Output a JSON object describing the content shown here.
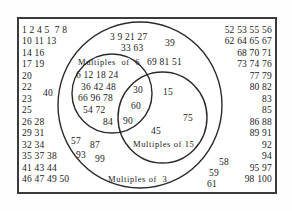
{
  "diagram": {
    "type": "venn-diagram",
    "universe_label": "",
    "border_color": "#3b3b3b",
    "circle_color": "#2b2b2b",
    "sets": [
      {
        "id": "multiples-of-3",
        "label": "Multiples of  3"
      },
      {
        "id": "multiples-of-6",
        "label": "Multiples  of  6"
      },
      {
        "id": "multiples-of-15",
        "label": "Multiples of 15"
      }
    ],
    "regions": {
      "outside_left": {
        "name": "outside-sets-left",
        "lines": [
          "1 2 4 5  7 8",
          "10 11 13",
          "14 16",
          "17 19",
          "20",
          "22",
          "23",
          "25",
          "26 28",
          "29 31",
          "32 34",
          "35 37 38",
          "41 43 44",
          "46 47 49 50"
        ],
        "floating": [
          {
            "value": "40"
          }
        ]
      },
      "outside_right": {
        "name": "outside-sets-right",
        "lines": [
          "52 53 55 56",
          "62 64 65 67",
          "68 70 71",
          "73 74 76",
          "77 79",
          "80 82",
          "83",
          "85",
          "86 88",
          "89 91",
          "92",
          "94",
          "95 97",
          "98 100"
        ],
        "floating": [
          {
            "value": "58"
          },
          {
            "value": "59"
          },
          {
            "value": "61"
          }
        ]
      },
      "only_3": {
        "name": "multiples-of-3-only",
        "top_lines": [
          "3 9 21 27",
          "33 63",
          "39",
          "69 81 51"
        ],
        "bottom_values": [
          "57",
          "87",
          "93",
          "99"
        ]
      },
      "only_6": {
        "name": "multiples-of-6-only",
        "lines": [
          "6 12 18 24",
          "36 42 48",
          "66 96 78",
          "54 72",
          "84"
        ]
      },
      "only_15": {
        "name": "multiples-of-15-only",
        "values": [
          "15",
          "75",
          "45"
        ]
      },
      "intersection_6_15": {
        "name": "multiples-of-6-and-15",
        "values": [
          "30",
          "60",
          "90"
        ]
      }
    }
  }
}
